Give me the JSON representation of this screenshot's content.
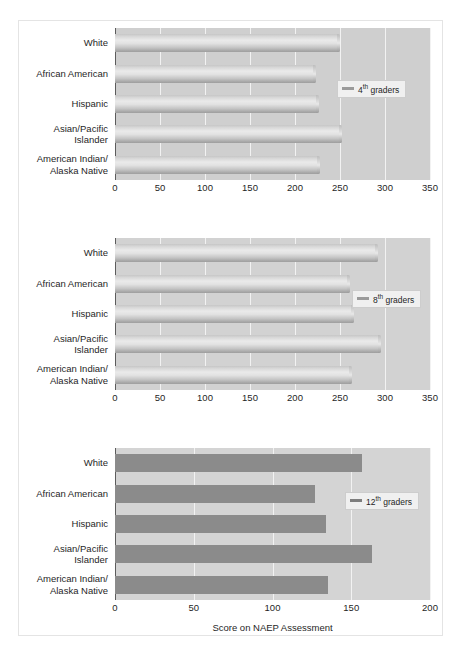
{
  "chart_data": [
    {
      "type": "bar",
      "orientation": "horizontal",
      "title": "",
      "xlabel": "",
      "ylabel": "",
      "xlim": [
        0,
        350
      ],
      "xticks": [
        0,
        50,
        100,
        150,
        200,
        250,
        300,
        350
      ],
      "grid": true,
      "legend": {
        "label": "4",
        "suffix": "th",
        "rest": " graders",
        "position": "right"
      },
      "categories": [
        "White",
        "African American",
        "Hispanic",
        "Asian/Pacific\nIslander",
        "American Indian/\nAlaska Native"
      ],
      "values": [
        250,
        223,
        227,
        252,
        228
      ],
      "bar_style": "glossy-light"
    },
    {
      "type": "bar",
      "orientation": "horizontal",
      "title": "",
      "xlabel": "",
      "ylabel": "",
      "xlim": [
        0,
        350
      ],
      "xticks": [
        0,
        50,
        100,
        150,
        200,
        250,
        300,
        350
      ],
      "grid": true,
      "legend": {
        "label": "8",
        "suffix": "th",
        "rest": " graders",
        "position": "right"
      },
      "categories": [
        "White",
        "African American",
        "Hispanic",
        "Asian/Pacific\nIslander",
        "American Indian/\nAlaska Native"
      ],
      "values": [
        292,
        261,
        265,
        295,
        263
      ],
      "bar_style": "glossy-light"
    },
    {
      "type": "bar",
      "orientation": "horizontal",
      "title": "",
      "xlabel": "Score on NAEP Assessment",
      "ylabel": "",
      "xlim": [
        0,
        200
      ],
      "xticks": [
        0,
        50,
        100,
        150,
        200
      ],
      "grid": true,
      "legend": {
        "label": "12",
        "suffix": "th",
        "rest": " graders",
        "position": "right"
      },
      "categories": [
        "White",
        "African American",
        "Hispanic",
        "Asian/Pacific\nIslander",
        "American Indian/\nAlaska Native"
      ],
      "values": [
        157,
        127,
        134,
        163,
        135
      ],
      "bar_style": "flat-dark"
    }
  ],
  "colors": {
    "plot_background_light": "#cfcfcf",
    "plot_background_dark": "#d4d4d4",
    "bar_light": "#dcdcdc",
    "bar_dark": "#8b8b8b",
    "gridline": "#f2f2f2",
    "axis": "#5c5c5c",
    "text": "#1f1f1f",
    "page_background": "#ffffff"
  }
}
